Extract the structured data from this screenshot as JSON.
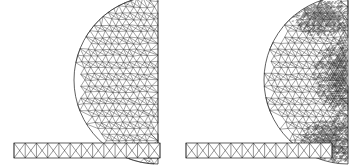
{
  "figure": {
    "panel_count": 2,
    "background_color": "#ffffff",
    "mesh_line_color": "#2b2b2b",
    "refined_region_color": "#1a1a1a"
  },
  "panels": [
    {
      "id": "panel-left",
      "name": "uniform-mesh",
      "caption": "",
      "origin_x": 0,
      "width": 178,
      "height": 168,
      "disk": {
        "name": "half-disk-domain",
        "center_x": 158,
        "center_y": 80,
        "radius": 84,
        "flat_edge": "right",
        "mesh_type": "triangular",
        "nominal_cell_size": 7.0,
        "refined": false
      },
      "beam": {
        "name": "beam-strip-domain",
        "x": 14,
        "y": 143,
        "width": 146,
        "height": 15,
        "mesh_type": "crossed-quad",
        "cell_count": 13
      },
      "refinement_patches": []
    },
    {
      "id": "panel-right",
      "name": "adaptive-mesh",
      "caption": "",
      "origin_x": 178,
      "width": 177,
      "height": 168,
      "disk": {
        "name": "half-disk-domain",
        "center_x": 170,
        "center_y": 80,
        "radius": 84,
        "flat_edge": "right",
        "mesh_type": "triangular",
        "nominal_cell_size": 7.0,
        "refined": true
      },
      "beam": {
        "name": "beam-strip-domain",
        "x": 8,
        "y": 143,
        "width": 146,
        "height": 15,
        "mesh_type": "crossed-quad",
        "cell_count": 13
      },
      "refinement_patches": [
        {
          "name": "patch-upper-right",
          "cx": 143,
          "cy": 16,
          "rx": 30,
          "ry": 20,
          "level": 4
        },
        {
          "name": "patch-mid-right",
          "cx": 160,
          "cy": 74,
          "rx": 26,
          "ry": 34,
          "level": 3
        },
        {
          "name": "patch-lower-right",
          "cx": 150,
          "cy": 142,
          "rx": 28,
          "ry": 24,
          "level": 4
        },
        {
          "name": "patch-right-edge",
          "cx": 168,
          "cy": 80,
          "rx": 16,
          "ry": 80,
          "level": 2
        }
      ]
    }
  ],
  "chart_data": {
    "type": "diagram",
    "subtype": "finite-element-mesh",
    "xlabel": "",
    "ylabel": "",
    "series": [
      {
        "name": "uniform mesh (left)",
        "values": []
      },
      {
        "name": "adaptive mesh (right)",
        "values": []
      }
    ]
  }
}
